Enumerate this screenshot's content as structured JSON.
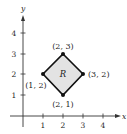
{
  "figure": {
    "axes": {
      "x_label": "x",
      "y_label": "y",
      "x_ticks": [
        "1",
        "2",
        "3",
        "4"
      ],
      "y_ticks": [
        "1",
        "2",
        "3",
        "4"
      ]
    },
    "region": {
      "label": "R",
      "fill_color": "#e3e3e3",
      "stroke_color": "#111111",
      "vertices": [
        {
          "label": "(2, 3)",
          "x": 2,
          "y": 3
        },
        {
          "label": "(3, 2)",
          "x": 3,
          "y": 2
        },
        {
          "label": "(2, 1)",
          "x": 2,
          "y": 1
        },
        {
          "label": "(1, 2)",
          "x": 1,
          "y": 2
        }
      ]
    }
  }
}
